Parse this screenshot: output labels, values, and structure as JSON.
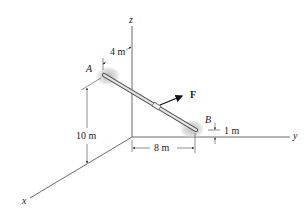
{
  "figure": {
    "axes": {
      "x_label": "x",
      "y_label": "y",
      "z_label": "z"
    },
    "points": {
      "A": "A",
      "B": "B"
    },
    "force": {
      "label": "F"
    },
    "dimensions": {
      "dim_4m": "4 m",
      "dim_10m": "10 m",
      "dim_8m": "8 m",
      "dim_1m": "1 m"
    },
    "colors": {
      "line": "#333333",
      "rod_fill": "#d8d8d8",
      "support_shadow": "#bdbdbd",
      "force_arrow": "#111111"
    }
  }
}
